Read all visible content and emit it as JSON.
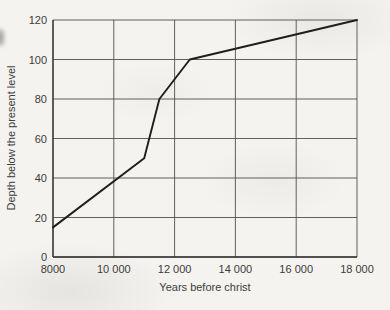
{
  "chart_data": {
    "type": "line",
    "title": "",
    "xlabel": "Years before christ",
    "ylabel": "Depth below the present level",
    "xlim": [
      8000,
      18000
    ],
    "ylim": [
      0,
      120
    ],
    "grid": true,
    "legend": "none",
    "x_ticks": {
      "values": [
        8000,
        10000,
        12000,
        14000,
        16000,
        18000
      ],
      "labels": [
        "8000",
        "10 000",
        "12 000",
        "14 000",
        "16 000",
        "18 000"
      ]
    },
    "y_ticks": {
      "values": [
        0,
        20,
        40,
        60,
        80,
        100,
        120
      ],
      "labels": [
        "0",
        "20",
        "40",
        "60",
        "80",
        "100",
        "120"
      ]
    },
    "series": [
      {
        "name": "depth-curve",
        "points": [
          [
            8000,
            15
          ],
          [
            11000,
            50
          ],
          [
            11500,
            80
          ],
          [
            12500,
            100
          ],
          [
            18000,
            120
          ]
        ]
      }
    ],
    "colors": {
      "line": "#1e1e1e",
      "grid": "#4f4f4f",
      "axis": "#333333",
      "text": "#3c3c3c",
      "paper": "#f4f3f0"
    }
  }
}
